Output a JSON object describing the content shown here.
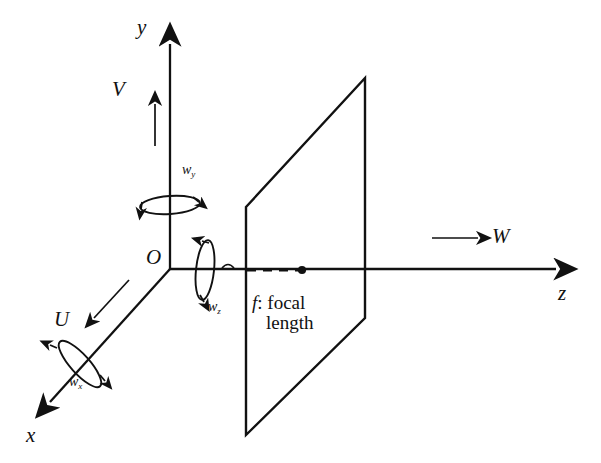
{
  "figure": {
    "background_color": "#ffffff",
    "ink_color": "#111111"
  },
  "axes": [
    {
      "id": "x-axis",
      "label": "x",
      "direction": "down-left (toward viewer)",
      "label_pos": {
        "x": 26,
        "y": 424
      }
    },
    {
      "id": "y-axis",
      "label": "y",
      "direction": "up",
      "label_pos": {
        "x": 137,
        "y": 16
      }
    },
    {
      "id": "z-axis",
      "label": "z",
      "direction": "right (optical axis)",
      "label_pos": {
        "x": 558,
        "y": 282
      }
    }
  ],
  "origin": {
    "label": "O",
    "label_pos": {
      "x": 146,
      "y": 246
    }
  },
  "translation_vectors": [
    {
      "id": "U",
      "label": "U",
      "along": "x-axis",
      "label_pos": {
        "x": 54,
        "y": 308
      }
    },
    {
      "id": "V",
      "label": "V",
      "along": "y-axis",
      "label_pos": {
        "x": 112,
        "y": 78
      }
    },
    {
      "id": "W",
      "label": "W",
      "along": "z-axis",
      "label_pos": {
        "x": 492,
        "y": 225
      }
    }
  ],
  "rotation_vectors": [
    {
      "id": "omega-x",
      "base": "w",
      "subscript": "x",
      "about": "x-axis",
      "label_pos": {
        "x": 69,
        "y": 375
      }
    },
    {
      "id": "omega-y",
      "base": "w",
      "subscript": "y",
      "about": "y-axis",
      "label_pos": {
        "x": 182,
        "y": 163
      }
    },
    {
      "id": "omega-z",
      "base": "w",
      "subscript": "z",
      "about": "z-axis",
      "label_pos": {
        "x": 208,
        "y": 300
      }
    }
  ],
  "annotations": {
    "focal": {
      "symbol": "f",
      "separator": ": focal",
      "line2": "length",
      "pos": {
        "x": 252,
        "y": 293
      }
    }
  },
  "image_plane": {
    "name": "image-plane",
    "corners": [
      {
        "x": 246,
        "y": 207
      },
      {
        "x": 365,
        "y": 78
      },
      {
        "x": 365,
        "y": 318
      },
      {
        "x": 246,
        "y": 435
      }
    ]
  },
  "focal_segment": {
    "name": "focal-length-dashed-segment",
    "from": {
      "x": 247,
      "y": 270
    },
    "to": {
      "x": 302,
      "y": 270
    },
    "style": "dashed",
    "endpoint_marker": "dot"
  }
}
